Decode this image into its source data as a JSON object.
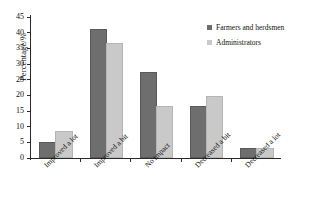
{
  "chart_data": {
    "type": "bar",
    "title": "",
    "xlabel": "",
    "ylabel": "Percentage/%",
    "ylim": [
      0,
      45
    ],
    "ytick_step": 5,
    "yticks": [
      0,
      5,
      10,
      15,
      20,
      25,
      30,
      35,
      40,
      45
    ],
    "grid": false,
    "legend_position": "top-right",
    "categories": [
      "Improved a lot",
      "Improved a bit",
      "No impact",
      "Decreased a bit",
      "Decreased a lot"
    ],
    "series": [
      {
        "name": "Farmers and herdsmen",
        "color": "#6e6e6e",
        "values": [
          4.5,
          40.6,
          26.8,
          16.0,
          2.5
        ]
      },
      {
        "name": "Administrators",
        "color": "#c9c9c9",
        "values": [
          8.0,
          36.2,
          16.0,
          19.0,
          2.5
        ]
      }
    ]
  },
  "colors": {
    "series_dark": "#6e6e6e",
    "series_light": "#c9c9c9",
    "axis": "#2a2a2a",
    "background": "#ffffff",
    "text": "#111111"
  }
}
